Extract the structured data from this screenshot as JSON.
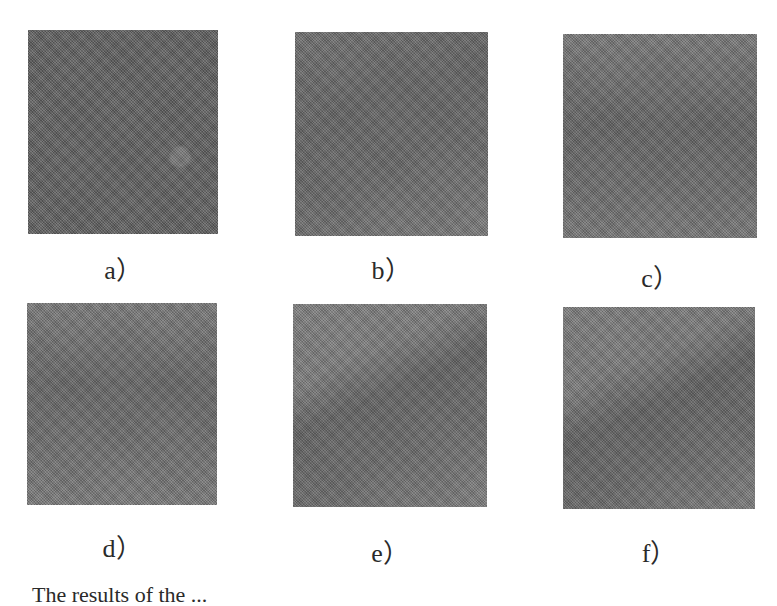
{
  "figure": {
    "panels": [
      {
        "id": "a",
        "label": "a）",
        "tone": "#5f5f5f",
        "band": "rgba(0,0,0,0.00)",
        "blob": true
      },
      {
        "id": "b",
        "label": "b）",
        "tone": "#747474",
        "band": "rgba(0,0,0,0.10)",
        "blob": false
      },
      {
        "id": "c",
        "label": "c）",
        "tone": "#737373",
        "band": "rgba(0,0,0,0.12)",
        "blob": false
      },
      {
        "id": "d",
        "label": "d）",
        "tone": "#767676",
        "band": "rgba(0,0,0,0.12)",
        "blob": false
      },
      {
        "id": "e",
        "label": "e）",
        "tone": "#787878",
        "band": "rgba(0,0,0,0.16)",
        "blob": false
      },
      {
        "id": "f",
        "label": "f）",
        "tone": "#767676",
        "band": "rgba(0,0,0,0.16)",
        "blob": false
      }
    ],
    "caption": "The results of the ..."
  }
}
